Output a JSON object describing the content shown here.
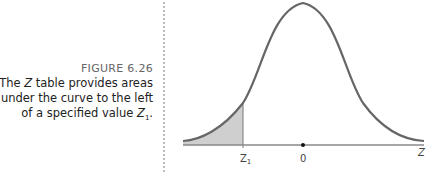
{
  "caption": {
    "title": "FIGURE 6.26",
    "line1_pre": "The ",
    "line1_var": "Z",
    "line1_post": " table provides areas",
    "line2": "under the curve to the left",
    "line3_pre": "of a specified value ",
    "line3_var": "Z",
    "line3_sub": "1",
    "line3_post": "."
  },
  "diagram": {
    "type": "normal-distribution-curve",
    "axis_labels": {
      "z1": "Z",
      "z1_sub": "1",
      "zero": "0",
      "z": "Z"
    },
    "shaded_region": "area left of Z1",
    "colors": {
      "curve": "#666666",
      "shade": "#cfcfcf",
      "axis": "#888888"
    }
  }
}
